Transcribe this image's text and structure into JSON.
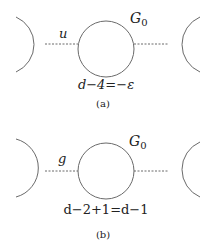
{
  "panels": [
    {
      "id": "a",
      "edge_label": "u",
      "node_label": "G",
      "node_subscript": "0",
      "equation": "d−4=−ε",
      "caption": "(a)"
    },
    {
      "id": "b",
      "edge_label": "g",
      "node_label": "G",
      "node_subscript": "0",
      "equation": "d−2+1=d−1",
      "caption": "(b)"
    }
  ],
  "colors": {
    "line": "#6a6a6a",
    "text": "#222222",
    "background": "#ffffff"
  }
}
